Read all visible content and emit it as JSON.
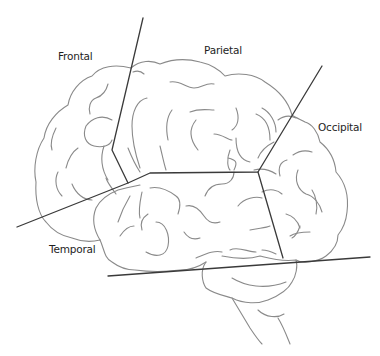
{
  "diagram": {
    "colors": {
      "background": "#ffffff",
      "outline": "#8a8a8a",
      "divider_lines": "#3a3a3a",
      "label_text": "#1e1e1e"
    },
    "labels": [
      {
        "id": "frontal",
        "text": "Frontal",
        "x": 58,
        "y": 50
      },
      {
        "id": "parietal",
        "text": "Parietal",
        "x": 204,
        "y": 44
      },
      {
        "id": "occipital",
        "text": "Occipital",
        "x": 318,
        "y": 121
      },
      {
        "id": "temporal",
        "text": "Temporal",
        "x": 49,
        "y": 243
      }
    ],
    "regions": [
      "Frontal lobe",
      "Parietal lobe",
      "Occipital lobe",
      "Temporal lobe",
      "Cerebellum",
      "Brain stem"
    ]
  }
}
